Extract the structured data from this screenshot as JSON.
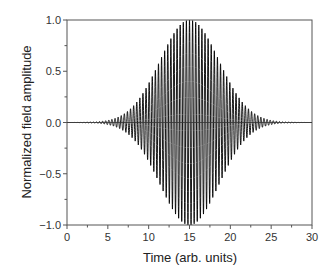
{
  "chart_data": {
    "type": "line",
    "title": "",
    "xlabel": "Time (arb. units)",
    "ylabel": "Normalized field amplitude",
    "xlim": [
      0,
      30
    ],
    "ylim": [
      -1.0,
      1.0
    ],
    "xticks": [
      0,
      5,
      10,
      15,
      20,
      25,
      30
    ],
    "xtick_labels": [
      "0",
      "5",
      "10",
      "15",
      "20",
      "25",
      "30"
    ],
    "yticks": [
      -1.0,
      -0.5,
      0.0,
      0.5,
      1.0
    ],
    "ytick_labels": [
      "−1.0",
      "−0.5",
      "0.0",
      "0.5",
      "1.0"
    ],
    "grid": false,
    "legend": null,
    "series": [
      {
        "name": "Gaussian-envelope pulse",
        "description": "Carrier oscillation under a Gaussian envelope, y = exp(-(t-15)^2/(2*sigma^2)) * cos(2*pi*(t-15)/period)",
        "envelope_center": 15,
        "envelope_sigma": 3.6,
        "envelope_fwhm_approx": 8.5,
        "carrier_period": 0.38,
        "peak_amplitude": 1.0,
        "t_start": 0,
        "t_end": 30,
        "sample_points": {
          "t": [
            0,
            3,
            5,
            7.5,
            10,
            12.5,
            15,
            17.5,
            20,
            22.5,
            25,
            27,
            30
          ],
          "envelope": [
            0.0002,
            0.004,
            0.021,
            0.114,
            0.381,
            0.786,
            1.0,
            0.786,
            0.381,
            0.114,
            0.021,
            0.004,
            0.0002
          ]
        },
        "color": "#000000"
      }
    ]
  },
  "colors": {
    "line": "#000000",
    "axis": "#555555",
    "text": "#333333"
  }
}
